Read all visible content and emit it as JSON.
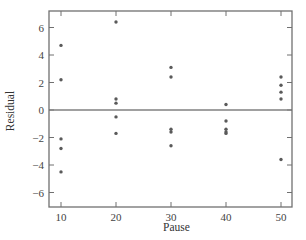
{
  "chart_data": {
    "type": "scatter",
    "title": "",
    "xlabel": "Pause",
    "ylabel": "Residual",
    "xlim": [
      7.8,
      52.3
    ],
    "ylim": [
      -7,
      7.2
    ],
    "xticks": [
      10,
      20,
      30,
      40,
      50
    ],
    "yticks": [
      -6,
      -4,
      -2,
      0,
      2,
      4,
      6
    ],
    "grid": false,
    "legend": null,
    "reference_line": {
      "y": 0
    },
    "points": [
      {
        "x": 10,
        "y": 4.7
      },
      {
        "x": 10,
        "y": 2.2
      },
      {
        "x": 10,
        "y": -2.1
      },
      {
        "x": 10,
        "y": -2.8
      },
      {
        "x": 10,
        "y": -4.5
      },
      {
        "x": 20,
        "y": 6.4
      },
      {
        "x": 20,
        "y": 0.8
      },
      {
        "x": 20,
        "y": 0.5
      },
      {
        "x": 20,
        "y": -0.5
      },
      {
        "x": 20,
        "y": -1.7
      },
      {
        "x": 30,
        "y": 3.1
      },
      {
        "x": 30,
        "y": 2.4
      },
      {
        "x": 30,
        "y": -1.4
      },
      {
        "x": 30,
        "y": -1.6
      },
      {
        "x": 30,
        "y": -2.6
      },
      {
        "x": 40,
        "y": 0.4
      },
      {
        "x": 40,
        "y": -0.8
      },
      {
        "x": 40,
        "y": -1.4
      },
      {
        "x": 40,
        "y": -1.6
      },
      {
        "x": 40,
        "y": -1.7
      },
      {
        "x": 50,
        "y": 2.4
      },
      {
        "x": 50,
        "y": 1.8
      },
      {
        "x": 50,
        "y": 1.3
      },
      {
        "x": 50,
        "y": 0.8
      },
      {
        "x": 50,
        "y": -3.6
      }
    ]
  },
  "colors": {
    "frame": "#707070",
    "points": "#5a5a5a",
    "zero_line": "#808080",
    "text": "#444444"
  }
}
